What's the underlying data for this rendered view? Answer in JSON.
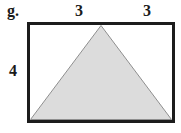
{
  "figure": {
    "label": "g.",
    "top_labels": [
      "3",
      "3"
    ],
    "left_label": "4",
    "shapes": {
      "rectangle": {
        "top_segments": [
          3,
          3
        ],
        "left_side": 4
      },
      "triangle": {
        "base": "bottom edge of rectangle",
        "apex": "top-center of rectangle"
      }
    },
    "colors": {
      "background": "#ffffff",
      "rectangle_border": "#1c1c1c",
      "triangle_fill": "#dcdcdc",
      "triangle_stroke": "#8f8f8f",
      "text": "#1a1a1a"
    }
  }
}
